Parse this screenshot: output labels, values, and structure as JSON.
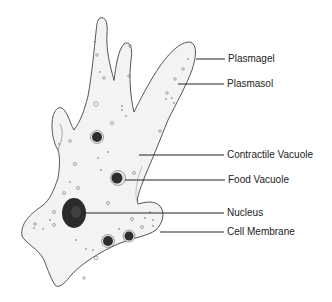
{
  "diagram": {
    "labels": [
      {
        "id": "plasmagel",
        "text": "Plasmagel",
        "x": 228,
        "y": 53
      },
      {
        "id": "plasmasol",
        "text": "Plasmasol",
        "x": 227,
        "y": 77
      },
      {
        "id": "contractile-vacuole",
        "text": "Contractile Vacuole",
        "x": 227,
        "y": 149
      },
      {
        "id": "food-vacuole",
        "text": "Food Vacuole",
        "x": 228,
        "y": 174
      },
      {
        "id": "nucleus",
        "text": "Nucleus",
        "x": 227,
        "y": 207
      },
      {
        "id": "cell-membrane",
        "text": "Cell Membrane",
        "x": 227,
        "y": 226
      }
    ],
    "colors": {
      "cytoplasm": "#f3f3f1",
      "outline": "#555555",
      "nucleus": "#2a2a2a",
      "leader_line": "#222222"
    }
  }
}
